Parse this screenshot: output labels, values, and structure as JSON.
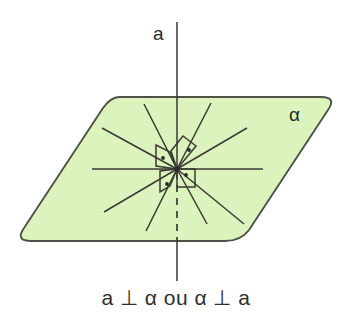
{
  "figure": {
    "kind": "geometry-diagram",
    "caption": "a ⊥ α ou α ⊥ a",
    "labels": {
      "line": "a",
      "plane": "α"
    },
    "colors": {
      "plane_fill": "#ddf3bd",
      "plane_stroke": "#4d5247",
      "line_stroke": "#3a3a33",
      "text": "#2d2d2d",
      "background": "#ffffff"
    },
    "geometry": {
      "center": {
        "x": 177,
        "y": 169
      },
      "plane_outline_points": "103,97 337,97 249,241 15,241",
      "plane_corner_radius": 16,
      "vertical_line": {
        "label": "a",
        "x": 177,
        "top_y": 22,
        "bottom_y": 281,
        "solid_above_plane_to_y": 169,
        "dashed_from_y": 172,
        "dashed_to_y": 241,
        "dash_pattern": "7 6"
      },
      "rays": [
        {
          "name": "ray-left-horizontal",
          "x2": 92,
          "y2": 169
        },
        {
          "name": "ray-right-horizontal",
          "x2": 263,
          "y2": 169
        },
        {
          "name": "ray-upper-left-shallow",
          "x2": 102,
          "y2": 128
        },
        {
          "name": "ray-upper-left-steep",
          "x2": 144,
          "y2": 104
        },
        {
          "name": "ray-upper-right-steep",
          "x2": 211,
          "y2": 103
        },
        {
          "name": "ray-upper-right-shallow",
          "x2": 247,
          "y2": 128
        },
        {
          "name": "ray-lower-left-shallow",
          "x2": 104,
          "y2": 212
        },
        {
          "name": "ray-lower-left-steep",
          "x2": 146,
          "y2": 231
        },
        {
          "name": "ray-lower-right-steep",
          "x2": 207,
          "y2": 224
        },
        {
          "name": "ray-lower-right-shallow",
          "x2": 244,
          "y2": 224
        }
      ],
      "right_angle_markers": [
        {
          "name": "right-angle-marker-upper-left",
          "dot": {
            "x": 163,
            "y": 158
          }
        },
        {
          "name": "right-angle-marker-upper-right",
          "dot": {
            "x": 189,
            "y": 150
          }
        },
        {
          "name": "right-angle-marker-lower-left",
          "dot": {
            "x": 167,
            "y": 184
          }
        },
        {
          "name": "right-angle-marker-lower-right",
          "dot": {
            "x": 186,
            "y": 175
          }
        }
      ]
    }
  }
}
